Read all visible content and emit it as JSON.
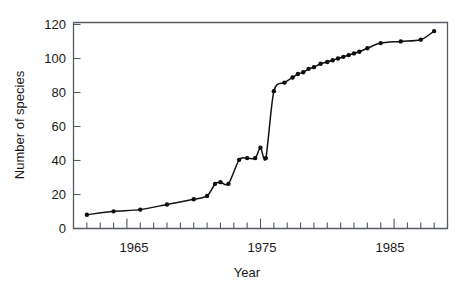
{
  "chart_data": {
    "type": "line",
    "title": "",
    "xlabel": "Year",
    "ylabel": "Number of species",
    "xlim": [
      1961,
      1989
    ],
    "ylim": [
      0,
      120
    ],
    "grid": false,
    "legend": null,
    "markers": "filled-circle",
    "line_style": "smooth-fitted-curve",
    "x_tick_labels": [
      "1965",
      "1975",
      "1985"
    ],
    "x_major_ticks": [
      1965,
      1975,
      1985
    ],
    "x_minor_tick_interval": 1,
    "y_tick_labels": [
      "0",
      "20",
      "40",
      "60",
      "80",
      "100",
      "120"
    ],
    "y_ticks": [
      0,
      20,
      40,
      60,
      80,
      100,
      120
    ],
    "series": [
      {
        "name": "Number of species",
        "x": [
          1962,
          1964,
          1966,
          1968,
          1970,
          1971,
          1971.6,
          1972,
          1972.6,
          1973.4,
          1974,
          1974.6,
          1975,
          1975.4,
          1976,
          1976.8,
          1977.4,
          1977.8,
          1978.2,
          1978.6,
          1979,
          1979.5,
          1980,
          1980.4,
          1980.8,
          1981.2,
          1981.6,
          1982,
          1982.4,
          1983,
          1984,
          1985.5,
          1987,
          1988
        ],
        "y": [
          8,
          10,
          11,
          14,
          17,
          19,
          26,
          27,
          26,
          40,
          41,
          41,
          47,
          41,
          80,
          85,
          88,
          90,
          91,
          93,
          94,
          96,
          97,
          98,
          99,
          100,
          101,
          102,
          103,
          105,
          108,
          109,
          110,
          115
        ]
      }
    ]
  },
  "axes": {
    "ylabel_text": "Number of species",
    "xlabel_text": "Year"
  }
}
